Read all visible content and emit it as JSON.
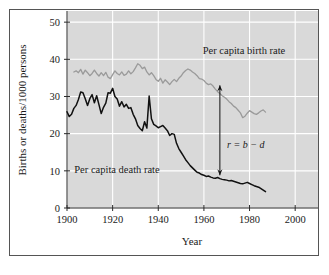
{
  "chart_data": {
    "type": "line",
    "title": "",
    "xlabel": "Year",
    "ylabel": "Births or deaths/1000 persons",
    "xlim": [
      1900,
      2010
    ],
    "ylim": [
      0,
      53
    ],
    "xticks": [
      1900,
      1920,
      1940,
      1960,
      1980,
      2000
    ],
    "xtick_labels": [
      "1900",
      "1920",
      "1940",
      "1960",
      "1980",
      "2000"
    ],
    "yticks": [
      0,
      10,
      20,
      30,
      40,
      50
    ],
    "ytick_labels": [
      "0",
      "10",
      "20",
      "30",
      "40",
      "50"
    ],
    "grid": true,
    "grid_color": "#ffffff",
    "plot_background": "#d9d9d9",
    "legend_position": "inline-annotations",
    "series": [
      {
        "name": "Per capita birth rate",
        "label": "Per capita birth rate",
        "color": "#9a9a9a",
        "x": [
          1903,
          1904,
          1905,
          1906,
          1907,
          1908,
          1909,
          1910,
          1911,
          1912,
          1913,
          1914,
          1915,
          1916,
          1917,
          1918,
          1919,
          1920,
          1921,
          1922,
          1923,
          1924,
          1925,
          1926,
          1927,
          1928,
          1929,
          1930,
          1931,
          1932,
          1933,
          1934,
          1935,
          1936,
          1937,
          1938,
          1939,
          1940,
          1941,
          1942,
          1943,
          1944,
          1945,
          1946,
          1947,
          1948,
          1949,
          1950,
          1951,
          1952,
          1953,
          1954,
          1955,
          1956,
          1957,
          1958,
          1959,
          1960,
          1961,
          1962,
          1963,
          1964,
          1965,
          1966,
          1967,
          1968,
          1969,
          1970,
          1971,
          1972,
          1973,
          1974,
          1975,
          1976,
          1977,
          1978,
          1979,
          1980,
          1981,
          1982,
          1983,
          1984,
          1985,
          1986,
          1987
        ],
        "values": [
          36.6,
          36.9,
          36.4,
          37.3,
          36.0,
          37.1,
          36.4,
          35.6,
          36.2,
          37.1,
          36.2,
          35.5,
          36.4,
          35.6,
          36.5,
          35.2,
          34.8,
          35.9,
          36.9,
          36.2,
          35.8,
          36.6,
          35.7,
          36.0,
          36.9,
          36.1,
          36.7,
          37.7,
          38.8,
          38.4,
          37.5,
          37.9,
          36.6,
          35.8,
          36.4,
          35.6,
          34.6,
          34.1,
          34.9,
          33.6,
          34.5,
          33.9,
          33.2,
          34.0,
          34.6,
          34.0,
          34.9,
          35.5,
          36.4,
          37.0,
          37.4,
          37.1,
          36.6,
          36.2,
          35.6,
          34.8,
          34.7,
          34.3,
          33.6,
          33.2,
          33.4,
          32.8,
          32.0,
          31.3,
          30.8,
          30.2,
          29.8,
          29.3,
          28.6,
          28.1,
          27.4,
          27.0,
          26.3,
          25.6,
          24.3,
          24.7,
          25.5,
          26.2,
          25.8,
          25.4,
          25.2,
          25.6,
          26.1,
          26.4,
          25.8
        ]
      },
      {
        "name": "Per capita death rate",
        "label": "Per capita death rate",
        "color": "#111111",
        "x": [
          1900,
          1901,
          1902,
          1903,
          1904,
          1905,
          1906,
          1907,
          1908,
          1909,
          1910,
          1911,
          1912,
          1913,
          1914,
          1915,
          1916,
          1917,
          1918,
          1919,
          1920,
          1921,
          1922,
          1923,
          1924,
          1925,
          1926,
          1927,
          1928,
          1929,
          1930,
          1931,
          1932,
          1933,
          1934,
          1935,
          1936,
          1937,
          1938,
          1939,
          1940,
          1941,
          1942,
          1943,
          1944,
          1945,
          1946,
          1947,
          1948,
          1949,
          1950,
          1951,
          1952,
          1953,
          1954,
          1955,
          1956,
          1957,
          1958,
          1959,
          1960,
          1961,
          1962,
          1963,
          1964,
          1965,
          1966,
          1967,
          1968,
          1969,
          1970,
          1971,
          1972,
          1973,
          1974,
          1975,
          1976,
          1977,
          1978,
          1979,
          1980,
          1981,
          1982,
          1983,
          1984,
          1985,
          1986,
          1987
        ],
        "values": [
          25.9,
          24.6,
          25.2,
          26.8,
          27.6,
          29.2,
          31.2,
          31.0,
          29.4,
          27.6,
          29.4,
          30.5,
          28.3,
          30.2,
          27.8,
          25.4,
          27.1,
          28.2,
          31.0,
          30.9,
          32.2,
          30.0,
          29.3,
          27.4,
          28.6,
          27.2,
          27.9,
          26.8,
          27.0,
          25.2,
          24.0,
          22.2,
          21.4,
          20.8,
          23.2,
          21.5,
          30.1,
          24.0,
          22.5,
          22.1,
          21.6,
          21.9,
          22.2,
          21.5,
          20.8,
          19.5,
          20.0,
          19.8,
          17.4,
          16.0,
          15.0,
          14.0,
          13.0,
          12.2,
          11.4,
          10.8,
          10.2,
          9.6,
          9.4,
          9.0,
          8.8,
          8.5,
          8.6,
          8.3,
          8.1,
          8.0,
          8.2,
          7.9,
          7.7,
          7.6,
          7.5,
          7.3,
          7.4,
          7.2,
          7.0,
          6.8,
          6.6,
          6.5,
          6.7,
          6.9,
          6.6,
          6.3,
          6.0,
          5.8,
          5.6,
          5.2,
          4.8,
          4.4
        ]
      }
    ],
    "annotations": [
      {
        "name": "growth-rate-annotation",
        "text": "r = b − d",
        "x_year": 1967,
        "y_top": 33.0,
        "y_bottom": 8.8,
        "arrow": "double-headed-vertical"
      }
    ]
  }
}
